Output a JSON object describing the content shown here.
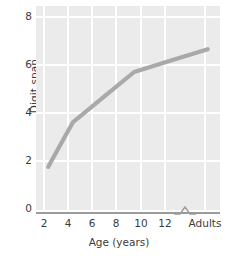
{
  "chart_data": {
    "type": "line",
    "title": "",
    "xlabel": "Age (years)",
    "ylabel": "Digit span",
    "x": [
      2,
      4,
      9,
      15
    ],
    "values": [
      1.8,
      3.65,
      5.75,
      6.7
    ],
    "categories": [
      "2",
      "4",
      "9",
      "Adults"
    ],
    "series": [
      {
        "name": "Digit span",
        "values": [
          1.8,
          3.65,
          5.75,
          6.7
        ],
        "color": "#a9a9a9"
      }
    ],
    "xtick_labels": [
      "2",
      "4",
      "6",
      "8",
      "10",
      "12",
      "Adults"
    ],
    "xtick_positions": [
      2,
      4,
      6,
      8,
      10,
      12,
      15
    ],
    "ytick_labels": [
      "0",
      "2",
      "4",
      "6",
      "8"
    ],
    "ytick_values": [
      0,
      2,
      4,
      6,
      8
    ],
    "xlim": [
      1,
      16
    ],
    "ylim": [
      0,
      8.5
    ],
    "grid": true,
    "legend": "none",
    "axis_break": true,
    "axis_break_after": 13,
    "panel_color": "#ebebeb",
    "grid_color": "#ffffff",
    "axis_color": "#9b9b9b",
    "text_color": "#3b3b3b"
  },
  "axes": {
    "y_ticks": [
      {
        "label": "8",
        "top": 11
      },
      {
        "label": "6",
        "top": 59
      },
      {
        "label": "4",
        "top": 107
      },
      {
        "label": "2",
        "top": 155
      },
      {
        "label": "0",
        "top": 203
      }
    ],
    "x_ticks": [
      {
        "label": "2",
        "left": 44
      },
      {
        "label": "4",
        "left": 68
      },
      {
        "label": "6",
        "left": 92
      },
      {
        "label": "8",
        "left": 116
      },
      {
        "label": "10",
        "left": 141
      },
      {
        "label": "12",
        "left": 165
      },
      {
        "label": "Adults",
        "left": 205
      }
    ]
  }
}
